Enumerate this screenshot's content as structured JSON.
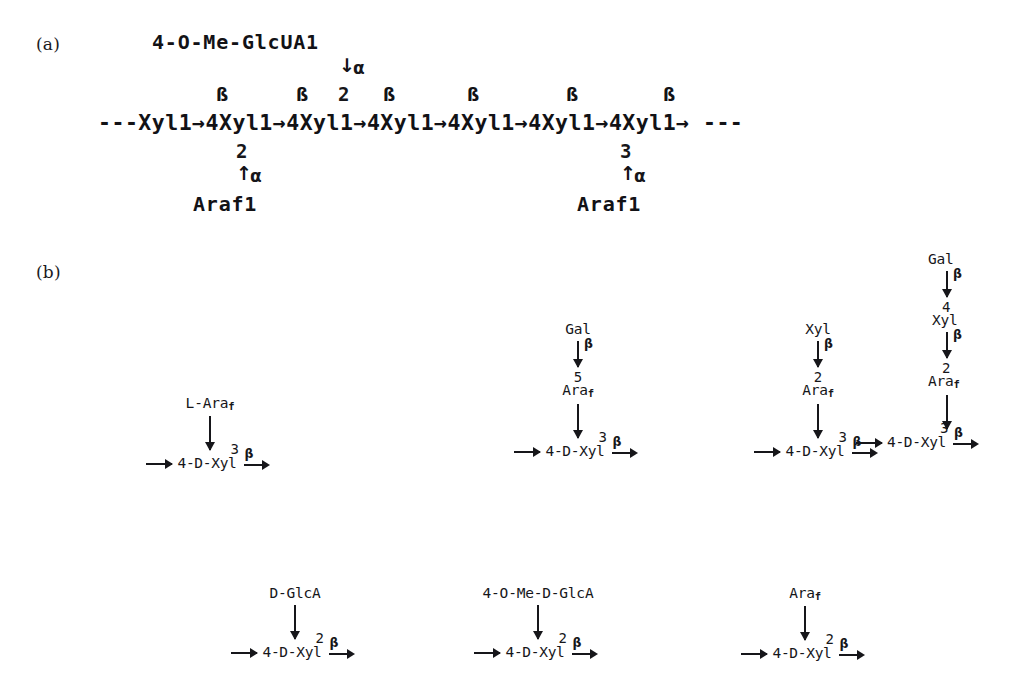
{
  "figure": {
    "panels": [
      {
        "id": "a",
        "label": "(a)"
      },
      {
        "id": "b",
        "label": "(b)"
      }
    ]
  },
  "panel_a": {
    "label": "(a)",
    "side_top": {
      "residue": "4-O-Me-GlcUA1",
      "anomeric": "α",
      "attach_position": "2"
    },
    "backbone": "---Xyl1→4Xyl1→4Xyl1→4Xyl1→4Xyl1→4Xyl1→4Xyl1→ ---",
    "backbone_left": "---Xyl1",
    "backbone_repeat": "→4Xyl1",
    "backbone_right": "→ ---",
    "beta_labels": [
      "ß",
      "ß",
      "ß",
      "ß",
      "ß",
      "ß"
    ],
    "branches_below": [
      {
        "residue": "Araf1",
        "anomeric": "α",
        "attach_position": "2"
      },
      {
        "residue": "Araf1",
        "anomeric": "α",
        "attach_position": "3"
      }
    ]
  },
  "panel_b": {
    "label": "(b)",
    "row_top": [
      {
        "id": "b1",
        "chain": [
          {
            "position": "",
            "residue": "L-Ara",
            "sub": "f",
            "link": ""
          }
        ],
        "backbone": {
          "in_arrow": "→",
          "text": "4-D-Xyl",
          "superscript": "3",
          "out_label": "β"
        }
      },
      {
        "id": "b2",
        "chain": [
          {
            "position": "",
            "residue": "Gal",
            "sub": "",
            "link": "β"
          },
          {
            "position": "5",
            "residue": "Ara",
            "sub": "f",
            "link": ""
          }
        ],
        "backbone": {
          "in_arrow": "→",
          "text": "4-D-Xyl",
          "superscript": "3",
          "out_label": "β"
        }
      },
      {
        "id": "b3",
        "chain": [
          {
            "position": "",
            "residue": "Xyl",
            "sub": "",
            "link": "β"
          },
          {
            "position": "2",
            "residue": "Ara",
            "sub": "f",
            "link": ""
          }
        ],
        "backbone": {
          "in_arrow": "→",
          "text": "4-D-Xyl",
          "superscript": "3",
          "out_label": "β"
        }
      },
      {
        "id": "b4",
        "chain": [
          {
            "position": "",
            "residue": "Gal",
            "sub": "",
            "link": "β"
          },
          {
            "position": "4",
            "residue": "Xyl",
            "sub": "",
            "link": "β"
          },
          {
            "position": "2",
            "residue": "Ara",
            "sub": "f",
            "link": ""
          }
        ],
        "backbone": {
          "in_arrow": "→",
          "text": "4-D-Xyl",
          "superscript": "3",
          "out_label": "β"
        }
      }
    ],
    "row_bottom": [
      {
        "id": "b5",
        "chain": [
          {
            "position": "",
            "residue": "D-GlcA",
            "sub": "",
            "link": ""
          }
        ],
        "backbone": {
          "in_arrow": "→",
          "text": "4-D-Xyl",
          "superscript": "2",
          "out_label": "β"
        }
      },
      {
        "id": "b6",
        "chain": [
          {
            "position": "",
            "residue": "4-O-Me-D-GlcA",
            "sub": "",
            "link": ""
          }
        ],
        "backbone": {
          "in_arrow": "→",
          "text": "4-D-Xyl",
          "superscript": "2",
          "out_label": "β"
        }
      },
      {
        "id": "b7",
        "chain": [
          {
            "position": "",
            "residue": "Ara",
            "sub": "f",
            "link": ""
          }
        ],
        "backbone": {
          "in_arrow": "→",
          "text": "4-D-Xyl",
          "superscript": "2",
          "out_label": "β"
        }
      }
    ]
  },
  "colors": {
    "background": "#ffffff",
    "ink": "#16161a"
  }
}
